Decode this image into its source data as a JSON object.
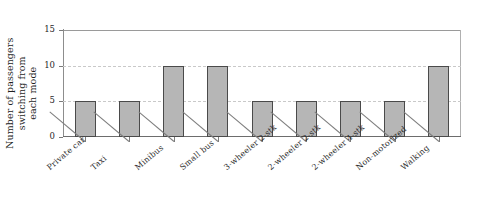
{
  "chart_data": {
    "type": "bar",
    "title": "",
    "subtitle": "",
    "xlabel": "",
    "ylabel": "Number of passengers switching from\neach mode",
    "ylabel_lines": [
      "Number of passengers switching from",
      "each mode"
    ],
    "categories": [
      "Private car",
      "Taxi",
      "Minibus",
      "Small bus",
      "3-wheeler 2-stk",
      "2-wheeler 2-stk",
      "2-wheeler 4-stk",
      "Non-motorized",
      "Walking"
    ],
    "values": [
      5,
      5,
      10,
      10,
      5,
      5,
      5,
      5,
      10
    ],
    "ylim": [
      0,
      15
    ],
    "ytick_values": [
      0,
      5,
      10,
      15
    ],
    "ytick_labels": [
      "0",
      "5",
      "10",
      "15"
    ],
    "grid": "horizontal-dashed",
    "legend": "none",
    "bar_fill_color": "#b6b6b6",
    "bar_border_color": "#4a4a4a",
    "gridline_color": "#c9c9c9",
    "axis_color": "#7a7a7a",
    "background_color": "#ffffff"
  }
}
